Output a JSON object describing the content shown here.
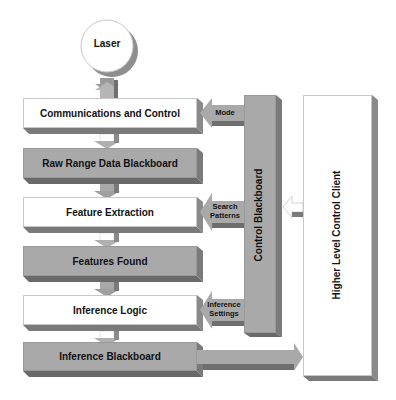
{
  "diagram": {
    "source": {
      "label": "Laser"
    },
    "pipeline": [
      {
        "id": "comm",
        "label": "Communications and Control",
        "style": "white"
      },
      {
        "id": "raw",
        "label": "Raw Range Data Blackboard",
        "style": "gray"
      },
      {
        "id": "feat",
        "label": "Feature Extraction",
        "style": "white"
      },
      {
        "id": "found",
        "label": "Features Found",
        "style": "gray"
      },
      {
        "id": "infer",
        "label": "Inference Logic",
        "style": "white"
      },
      {
        "id": "infbb",
        "label": "Inference Blackboard",
        "style": "gray"
      }
    ],
    "control_blackboard": {
      "label": "Control Blackboard"
    },
    "client": {
      "label": "Higher Level Control Client"
    },
    "control_arrows": [
      {
        "label_line1": "Mode",
        "label_line2": "",
        "target": "comm"
      },
      {
        "label_line1": "Search",
        "label_line2": "Patterns",
        "target": "feat"
      },
      {
        "label_line1": "Inference",
        "label_line2": "Settings",
        "target": "infer"
      }
    ],
    "colors": {
      "gray_box": "#a9a9a9",
      "shadow": "#6e6e6e",
      "white_box": "#ffffff",
      "text": "#111111"
    }
  }
}
